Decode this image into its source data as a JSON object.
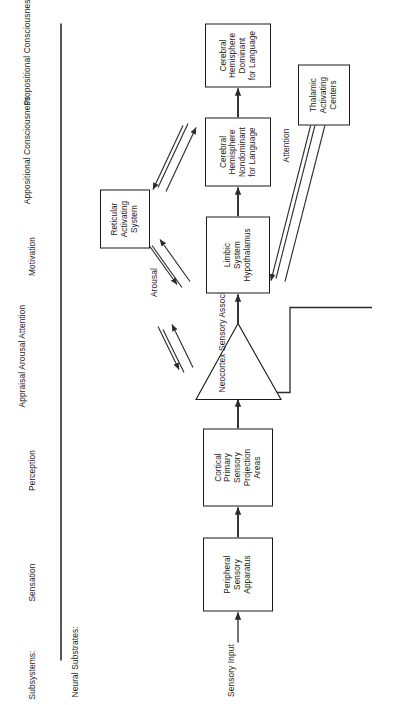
{
  "figure": {
    "title_row_label": "Subsystems:",
    "substrate_row_label": "Neural Substrates:"
  },
  "subsystems": [
    {
      "id": "sensation",
      "lines": [
        "Sensation"
      ]
    },
    {
      "id": "perception",
      "lines": [
        "Perception"
      ]
    },
    {
      "id": "appraisal",
      "lines": [
        "Appraisal",
        "Arousal",
        "Attention"
      ]
    },
    {
      "id": "motivation",
      "lines": [
        "Motivation"
      ]
    },
    {
      "id": "appositional",
      "lines": [
        "Appositional",
        "Consciousness"
      ]
    },
    {
      "id": "propositional",
      "lines": [
        "Propositional",
        "Consciousness"
      ]
    }
  ],
  "nodes": {
    "sensory_input": {
      "lines": [
        "Sensory",
        "Input"
      ]
    },
    "peripheral": {
      "lines": [
        "Peripheral",
        "Sensory",
        "Apparatus"
      ]
    },
    "cortical": {
      "lines": [
        "Cortical",
        "Primary",
        "Sensory",
        "Projection",
        "Areas"
      ]
    },
    "neocortex": {
      "lines": [
        "Neocortex",
        "Sensory",
        "Association",
        "Areas"
      ]
    },
    "limbic": {
      "lines": [
        "Limbic",
        "System",
        "Hypothalamus"
      ]
    },
    "nondominant": {
      "lines": [
        "Cerebral",
        "Hemisphere",
        "Nondominant",
        "for Language"
      ]
    },
    "dominant": {
      "lines": [
        "Cerebral",
        "Hemisphere",
        "Dominant",
        "for Language"
      ]
    },
    "reticular": {
      "lines": [
        "Reticular",
        "Activating",
        "System"
      ]
    },
    "thalamic": {
      "lines": [
        "Thalamic",
        "Activating",
        "Centers"
      ]
    }
  },
  "edge_labels": {
    "arousal": "Arousal",
    "attention": "Attention"
  },
  "colors": {
    "ink": "#1a1a1a",
    "rule": "#555555",
    "arrow": "#2b2b2b",
    "background": "#ffffff"
  }
}
